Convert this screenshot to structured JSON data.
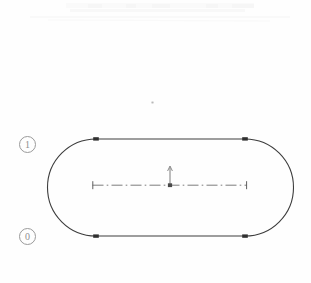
{
  "canvas": {
    "width": 311,
    "height": 283,
    "background_color": "#fefefe",
    "title": "Obround slot profile sketch"
  },
  "labels": {
    "top_left": {
      "text": "1",
      "name": "circled-label-one",
      "x": 19,
      "y": 136,
      "color": "#8f8f8f"
    },
    "bottom_left": {
      "text": "0",
      "name": "circled-label-zero",
      "x": 19,
      "y": 228,
      "color": "#8f8f8f"
    }
  },
  "geometry": {
    "profile": {
      "name": "obround-profile",
      "type": "stadium",
      "stroke_color": "#3c3c3c",
      "stroke_width": 1.1,
      "left_arc_center_x": 96,
      "right_arc_center_x": 245,
      "center_y": 187.5,
      "radius": 48.5,
      "top_y": 139,
      "bottom_y": 236,
      "left_x": 47.5,
      "right_x": 293.5
    },
    "vertices": [
      {
        "name": "vertex-top-left",
        "x": 96,
        "y": 139
      },
      {
        "name": "vertex-top-right",
        "x": 245,
        "y": 139
      },
      {
        "name": "vertex-bottom-left",
        "x": 96,
        "y": 236
      },
      {
        "name": "vertex-bottom-right",
        "x": 245,
        "y": 236
      }
    ],
    "horizontal_centerline": {
      "name": "horizontal-centerline",
      "x1": 92,
      "x2": 247,
      "y": 185,
      "style": "dash-dot",
      "color": "#6e6e6e",
      "end_caps": "tick"
    },
    "vertical_axis_arrow": {
      "name": "vertical-axis-arrow",
      "x": 170,
      "y_base": 185,
      "y_tip": 166,
      "color": "#6e6e6e",
      "direction": "up"
    },
    "origin_point": {
      "name": "origin-marker",
      "x": 170,
      "y": 185,
      "color": "#555555"
    }
  },
  "artifacts": {
    "speck": {
      "name": "scan-speck",
      "x": 152,
      "y": 102,
      "color": "#cfcfcf"
    },
    "top_band": {
      "name": "scan-band",
      "x": 66,
      "y": 2,
      "width": 190,
      "height": 12,
      "color": "#f6f6f6"
    }
  }
}
